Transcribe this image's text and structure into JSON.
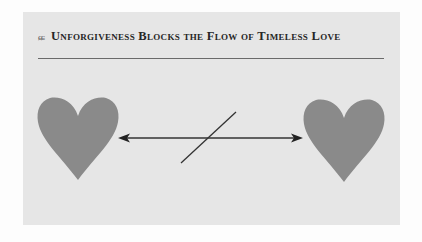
{
  "header": {
    "ornament": "ɕɕ",
    "title": "Unforgiveness Blocks the Flow of Timeless Love"
  },
  "diagram": {
    "left_heart": {
      "label": "heart",
      "color": "#8a8a8a"
    },
    "right_heart": {
      "label": "heart",
      "color": "#8a8a8a"
    },
    "connector": {
      "type": "double-headed-arrow",
      "blocked": true,
      "color": "#333333"
    }
  },
  "colors": {
    "panel_background": "#e6e6e6",
    "heart_fill": "#8a8a8a",
    "line": "#333333"
  }
}
